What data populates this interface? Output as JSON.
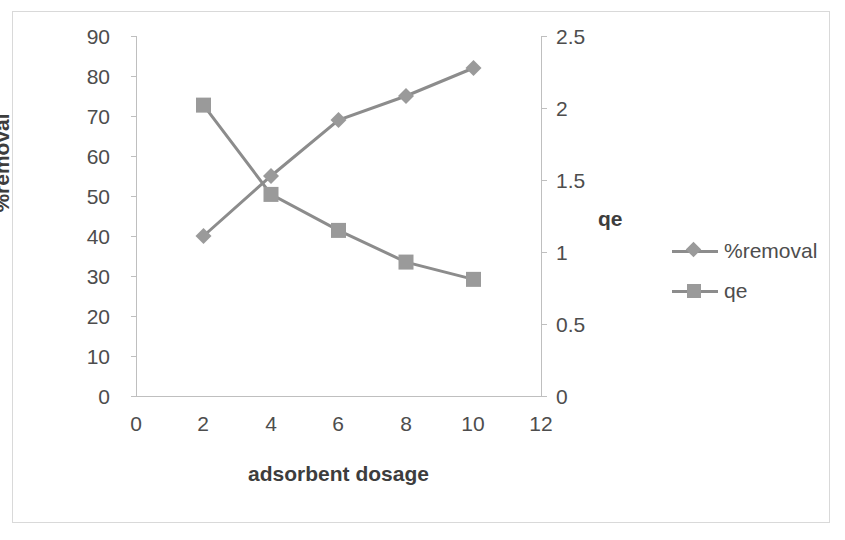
{
  "chart_data": {
    "type": "line",
    "title": "",
    "xlabel": "adsorbent dosage",
    "ylabel": "%removal",
    "y2label": "qe",
    "x": [
      2,
      4,
      6,
      8,
      10
    ],
    "xlim": [
      0,
      12
    ],
    "xticks": [
      "0",
      "2",
      "4",
      "6",
      "8",
      "10",
      "12"
    ],
    "ylim": [
      0,
      90
    ],
    "yticks": [
      "0",
      "10",
      "20",
      "30",
      "40",
      "50",
      "60",
      "70",
      "80",
      "90"
    ],
    "y2lim": [
      0,
      2.5
    ],
    "y2ticks": [
      "0",
      "0.5",
      "1",
      "1.5",
      "2",
      "2.5"
    ],
    "grid": false,
    "legend_position": "right",
    "series": [
      {
        "name": "%removal",
        "axis": "left",
        "marker": "diamond",
        "color": "#8c8c8c",
        "values": [
          40,
          55,
          69,
          75,
          82
        ]
      },
      {
        "name": "qe",
        "axis": "right",
        "marker": "square",
        "color": "#8c8c8c",
        "values": [
          2.02,
          1.4,
          1.15,
          0.93,
          0.81
        ]
      }
    ]
  },
  "axes": {
    "y_left_title": "%removal",
    "y_right_title": "qe",
    "x_title": "adsorbent dosage",
    "x_tick_labels": [
      "0",
      "2",
      "4",
      "6",
      "8",
      "10",
      "12"
    ],
    "y_left_tick_labels": [
      "90",
      "80",
      "70",
      "60",
      "50",
      "40",
      "30",
      "20",
      "10",
      "0"
    ],
    "y_right_tick_labels": [
      "2.5",
      "2",
      "1.5",
      "1",
      "0.5",
      "0"
    ]
  },
  "legend": {
    "items": [
      {
        "label": "%removal",
        "marker": "diamond-marker-icon"
      },
      {
        "label": "qe",
        "marker": "square-marker-icon"
      }
    ]
  },
  "colors": {
    "series": "#8c8c8c",
    "marker": "#9a9a9a",
    "axis": "#bfbfbf",
    "text": "#4d4d4d",
    "frame": "#d9d9d9",
    "background": "#ffffff"
  }
}
